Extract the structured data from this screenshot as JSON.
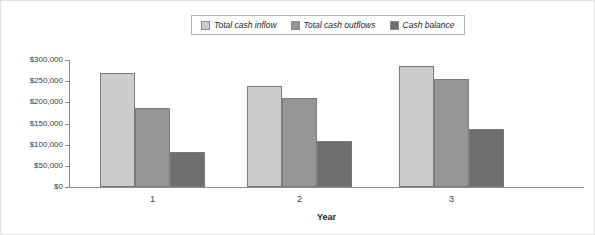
{
  "chart_data": {
    "type": "bar",
    "title": "",
    "xlabel": "Year",
    "ylabel": "",
    "categories": [
      "1",
      "2",
      "3"
    ],
    "series": [
      {
        "name": "Total cash inflow",
        "color": "#cccccc",
        "values": [
          269000,
          238000,
          287000
        ]
      },
      {
        "name": "Total cash outflows",
        "color": "#969696",
        "values": [
          186000,
          211000,
          255000
        ]
      },
      {
        "name": "Cash balance",
        "color": "#6e6e6e",
        "values": [
          83000,
          108000,
          137000
        ]
      }
    ],
    "ylim": [
      0,
      300000
    ],
    "ytick_values": [
      0,
      50000,
      100000,
      150000,
      200000,
      250000,
      300000
    ],
    "ytick_labels": [
      "$0",
      "$50,000",
      "$100,000",
      "$150,000",
      "$200,000",
      "$250,000",
      "$300,000"
    ],
    "grid": false,
    "legend_position": "top-center"
  },
  "legend": {
    "items": [
      {
        "label": "Total cash inflow",
        "color": "#cccccc"
      },
      {
        "label": "Total cash outflows",
        "color": "#969696"
      },
      {
        "label": "Cash balance",
        "color": "#6e6e6e"
      }
    ]
  },
  "axes": {
    "x_title": "Year",
    "x_labels": [
      "1",
      "2",
      "3"
    ],
    "y_labels": [
      "$300,000",
      "$250,000",
      "$200,000",
      "$150,000",
      "$100,000",
      "$50,000",
      "$0"
    ]
  }
}
